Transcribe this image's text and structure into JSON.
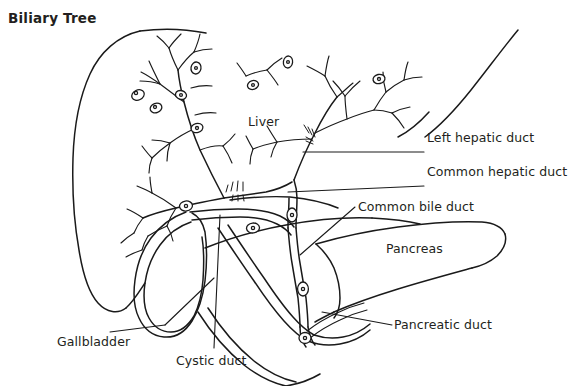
{
  "figure": {
    "title": "Biliary Tree",
    "width": 578,
    "height": 386,
    "background_color": "#ffffff",
    "ink_color": "#1a1a1a",
    "text_color": "#231f20",
    "style": "black-and-white line drawing, medical anatomy illustration"
  },
  "labels": {
    "liver": "Liver",
    "left_hepatic_duct": "Left hepatic duct",
    "common_hepatic_duct": "Common hepatic duct",
    "common_bile_duct": "Common bile duct",
    "pancreas": "Pancreas",
    "pancreatic_duct": "Pancreatic duct",
    "gallbladder": "Gallbladder",
    "cystic_duct": "Cystic duct"
  },
  "label_positions": {
    "liver": {
      "x": 248,
      "y": 116
    },
    "left_hepatic_duct": {
      "x": 427,
      "y": 132
    },
    "common_hepatic_duct": {
      "x": 427,
      "y": 166
    },
    "common_bile_duct": {
      "x": 358,
      "y": 201
    },
    "pancreas": {
      "x": 386,
      "y": 243
    },
    "pancreatic_duct": {
      "x": 394,
      "y": 319
    },
    "gallbladder": {
      "x": 57,
      "y": 336
    },
    "cystic_duct": {
      "x": 176,
      "y": 355
    }
  },
  "structures": [
    {
      "name": "liver",
      "description": "large organ outline occupying upper-left and center of the figure"
    },
    {
      "name": "intrahepatic-bile-ducts",
      "description": "branching tree of small bile ducts inside the liver"
    },
    {
      "name": "left-hepatic-duct",
      "description": "duct draining the left lobe, joins the common hepatic duct"
    },
    {
      "name": "right-hepatic-duct",
      "description": "duct draining the right lobe, joins the common hepatic duct"
    },
    {
      "name": "common-hepatic-duct",
      "description": "duct formed by union of right and left hepatic ducts"
    },
    {
      "name": "cystic-duct",
      "description": "duct connecting the gallbladder to the common hepatic duct"
    },
    {
      "name": "common-bile-duct",
      "description": "duct formed by cystic duct and common hepatic duct, runs to duodenum"
    },
    {
      "name": "gallbladder",
      "description": "pear shaped sac below the liver storing bile"
    },
    {
      "name": "pancreas",
      "description": "elongated tapering gland extending to the right"
    },
    {
      "name": "pancreatic-duct",
      "description": "duct within the pancreas joining the common bile duct"
    },
    {
      "name": "duodenum",
      "description": "C shaped first portion of small intestine receiving the ducts"
    }
  ]
}
